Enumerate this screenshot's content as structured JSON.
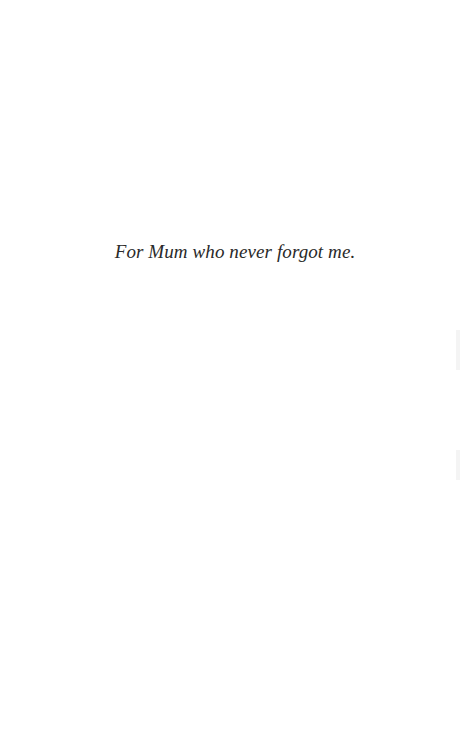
{
  "page": {
    "dedication": "For Mum who never forgot me."
  }
}
